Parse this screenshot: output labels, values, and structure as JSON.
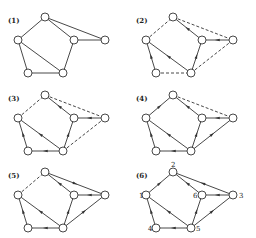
{
  "figure": {
    "node_positions": {
      "1": [
        18,
        40
      ],
      "2": [
        45,
        17
      ],
      "3": [
        105,
        40
      ],
      "4": [
        28,
        73
      ],
      "5": [
        63,
        73
      ],
      "6": [
        74,
        40
      ]
    },
    "node_labels_shown_in_panel_6": [
      "1",
      "2",
      "3",
      "4",
      "5",
      "6"
    ],
    "panels": [
      {
        "label": "(1)",
        "offset": [
          0,
          0
        ],
        "show_node_labels": false,
        "edges": [
          {
            "from": "1",
            "to": "2",
            "style": "solid",
            "arrow": false
          },
          {
            "from": "2",
            "to": "6",
            "style": "solid",
            "arrow": false
          },
          {
            "from": "2",
            "to": "3",
            "style": "solid",
            "arrow": false
          },
          {
            "from": "6",
            "to": "3",
            "style": "solid",
            "arrow": false
          },
          {
            "from": "1",
            "to": "4",
            "style": "solid",
            "arrow": false
          },
          {
            "from": "1",
            "to": "5",
            "style": "solid",
            "arrow": false
          },
          {
            "from": "4",
            "to": "5",
            "style": "solid",
            "arrow": false
          },
          {
            "from": "5",
            "to": "6",
            "style": "solid",
            "arrow": false
          }
        ]
      },
      {
        "label": "(2)",
        "offset": [
          128,
          0
        ],
        "show_node_labels": false,
        "edges": [
          {
            "from": "1",
            "to": "2",
            "style": "dashed",
            "arrow": false
          },
          {
            "from": "6",
            "to": "2",
            "style": "solid",
            "arrow": true
          },
          {
            "from": "2",
            "to": "3",
            "style": "dashed",
            "arrow": false
          },
          {
            "from": "3",
            "to": "6",
            "style": "solid",
            "arrow": true
          },
          {
            "from": "4",
            "to": "1",
            "style": "solid",
            "arrow": true
          },
          {
            "from": "5",
            "to": "1",
            "style": "solid",
            "arrow": true
          },
          {
            "from": "4",
            "to": "5",
            "style": "dashed",
            "arrow": false
          },
          {
            "from": "5",
            "to": "6",
            "style": "solid",
            "arrow": true
          },
          {
            "from": "5",
            "to": "3",
            "style": "dashed",
            "arrow": false
          }
        ]
      },
      {
        "label": "(3)",
        "offset": [
          0,
          78
        ],
        "show_node_labels": false,
        "edges": [
          {
            "from": "1",
            "to": "2",
            "style": "dashed",
            "arrow": false
          },
          {
            "from": "6",
            "to": "2",
            "style": "solid",
            "arrow": true
          },
          {
            "from": "2",
            "to": "3",
            "style": "dashed",
            "arrow": false
          },
          {
            "from": "3",
            "to": "6",
            "style": "solid",
            "arrow": true
          },
          {
            "from": "4",
            "to": "1",
            "style": "solid",
            "arrow": true
          },
          {
            "from": "5",
            "to": "1",
            "style": "solid",
            "arrow": true
          },
          {
            "from": "5",
            "to": "4",
            "style": "solid",
            "arrow": true
          },
          {
            "from": "5",
            "to": "6",
            "style": "solid",
            "arrow": true
          },
          {
            "from": "5",
            "to": "3",
            "style": "dashed",
            "arrow": false
          }
        ]
      },
      {
        "label": "(4)",
        "offset": [
          128,
          78
        ],
        "show_node_labels": false,
        "edges": [
          {
            "from": "1",
            "to": "2",
            "style": "solid",
            "arrow": true
          },
          {
            "from": "6",
            "to": "2",
            "style": "solid",
            "arrow": true
          },
          {
            "from": "2",
            "to": "3",
            "style": "dashed",
            "arrow": false
          },
          {
            "from": "3",
            "to": "6",
            "style": "solid",
            "arrow": true
          },
          {
            "from": "4",
            "to": "1",
            "style": "solid",
            "arrow": true
          },
          {
            "from": "5",
            "to": "1",
            "style": "solid",
            "arrow": true
          },
          {
            "from": "5",
            "to": "4",
            "style": "solid",
            "arrow": true
          },
          {
            "from": "5",
            "to": "6",
            "style": "solid",
            "arrow": true
          },
          {
            "from": "5",
            "to": "3",
            "style": "solid",
            "arrow": true
          }
        ]
      },
      {
        "label": "(5)",
        "offset": [
          0,
          155
        ],
        "show_node_labels": false,
        "edges": [
          {
            "from": "1",
            "to": "2",
            "style": "dashed",
            "arrow": false
          },
          {
            "from": "6",
            "to": "2",
            "style": "solid",
            "arrow": true
          },
          {
            "from": "2",
            "to": "3",
            "style": "solid",
            "arrow": true
          },
          {
            "from": "3",
            "to": "6",
            "style": "solid",
            "arrow": true
          },
          {
            "from": "4",
            "to": "1",
            "style": "solid",
            "arrow": true
          },
          {
            "from": "5",
            "to": "1",
            "style": "solid",
            "arrow": true
          },
          {
            "from": "5",
            "to": "4",
            "style": "solid",
            "arrow": true
          },
          {
            "from": "5",
            "to": "6",
            "style": "solid",
            "arrow": true
          },
          {
            "from": "5",
            "to": "3",
            "style": "solid",
            "arrow": true
          }
        ]
      },
      {
        "label": "(6)",
        "offset": [
          128,
          155
        ],
        "show_node_labels": true,
        "edges": [
          {
            "from": "1",
            "to": "2",
            "style": "solid",
            "arrow": true
          },
          {
            "from": "6",
            "to": "2",
            "style": "solid",
            "arrow": true
          },
          {
            "from": "3",
            "to": "2",
            "style": "solid",
            "arrow": true
          },
          {
            "from": "3",
            "to": "6",
            "style": "solid",
            "arrow": true
          },
          {
            "from": "4",
            "to": "1",
            "style": "solid",
            "arrow": true
          },
          {
            "from": "5",
            "to": "1",
            "style": "solid",
            "arrow": true
          },
          {
            "from": "5",
            "to": "4",
            "style": "solid",
            "arrow": true
          },
          {
            "from": "5",
            "to": "6",
            "style": "solid",
            "arrow": true
          },
          {
            "from": "5",
            "to": "3",
            "style": "solid",
            "arrow": true
          }
        ]
      }
    ]
  }
}
